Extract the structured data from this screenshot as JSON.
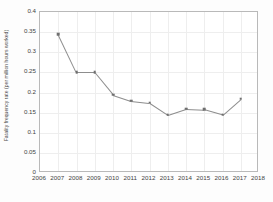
{
  "chart_data": {
    "type": "line",
    "title": "",
    "xlabel": "",
    "ylabel": "Fatality frequency rate (per million hours worked)",
    "x": [
      2007,
      2008,
      2009,
      2010,
      2011,
      2012,
      2013,
      2014,
      2015,
      2016,
      2017
    ],
    "values": [
      0.345,
      0.25,
      0.25,
      0.195,
      0.18,
      0.175,
      0.145,
      0.16,
      0.158,
      0.145,
      0.185
    ],
    "series": [
      {
        "name": "Fatality frequency rate",
        "values": [
          0.345,
          0.25,
          0.25,
          0.195,
          0.18,
          0.175,
          0.145,
          0.16,
          0.158,
          0.145,
          0.185
        ]
      }
    ],
    "xlim": [
      2006,
      2018
    ],
    "ylim": [
      0,
      0.4
    ],
    "y_ticks": [
      0,
      0.05,
      0.1,
      0.15,
      0.2,
      0.25,
      0.3,
      0.35,
      0.4
    ],
    "y_tick_labels": [
      "0",
      "0.05",
      "0.1",
      "0.15",
      "0.2",
      "0.25",
      "0.3",
      "0.35",
      "0.4"
    ],
    "x_ticks": [
      2006,
      2007,
      2008,
      2009,
      2010,
      2011,
      2012,
      2013,
      2014,
      2015,
      2016,
      2017,
      2018
    ],
    "x_tick_labels": [
      "2006",
      "2007",
      "2008",
      "2009",
      "2010",
      "2011",
      "2012",
      "2013",
      "2014",
      "2015",
      "2016",
      "2017",
      "2018"
    ],
    "grid": true,
    "legend": false,
    "marker": "square",
    "line_color": "#8d8d8d",
    "marker_color": "#6f6f6f",
    "grid_color": "#eeeeee",
    "axis_color": "#b9b9b9"
  }
}
